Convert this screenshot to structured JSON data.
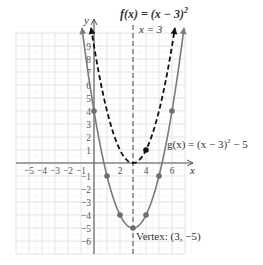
{
  "chart_data": {
    "type": "line",
    "title": "",
    "xlabel": "x",
    "ylabel": "y",
    "xlim": [
      -6,
      7
    ],
    "ylim": [
      -7,
      10
    ],
    "grid": true,
    "x_tick_labels": [
      "−5",
      "−4",
      "−3",
      "−2",
      "−1",
      "2",
      "4",
      "6"
    ],
    "x_ticks": [
      -5,
      -4,
      -3,
      -2,
      -1,
      2,
      4,
      6
    ],
    "y_tick_labels": [
      "9",
      "8",
      "7",
      "6",
      "5",
      "4",
      "3",
      "2",
      "1",
      "−1",
      "−2",
      "−3",
      "−4",
      "−5",
      "−6"
    ],
    "y_ticks": [
      9,
      8,
      7,
      6,
      5,
      4,
      3,
      2,
      1,
      -1,
      -2,
      -3,
      -4,
      -5,
      -6
    ],
    "series": [
      {
        "name": "f(x) = (x − 3)²",
        "style": "dashed",
        "color": "#111111",
        "equation": "(x-3)^2",
        "marked_points": [
          [
            4,
            1
          ]
        ]
      },
      {
        "name": "g(x) = (x − 3)² − 5",
        "style": "solid",
        "color": "#777777",
        "equation": "(x-3)^2-5",
        "marked_points": [
          [
            0,
            4
          ],
          [
            1,
            -1
          ],
          [
            2,
            -4
          ],
          [
            3,
            -5
          ],
          [
            4,
            -4
          ],
          [
            5,
            -1
          ],
          [
            6,
            4
          ]
        ]
      }
    ],
    "axis_of_symmetry": {
      "label": "x = 3",
      "x": 3,
      "style": "dashed"
    },
    "annotations": [
      {
        "text": "f(x) = (x − 3)²",
        "target": "f"
      },
      {
        "text": "x = 3",
        "target": "axis_of_symmetry"
      },
      {
        "text": "g(x) = (x − 3)² − 5",
        "target": "g"
      },
      {
        "text": "Vertex: (3, −5)",
        "target": "vertex",
        "point": [
          3,
          -5
        ]
      }
    ]
  },
  "labels": {
    "x_axis": "x",
    "y_axis": "y",
    "f_label_fx": "f(x)",
    "f_label_rest": " = (x − 3)",
    "f_label_exp": "2",
    "axis_label": "x = 3",
    "g_label": "g(x) = (x − 3)",
    "g_label_exp": "2",
    "g_label_tail": " − 5",
    "vertex_label": "Vertex: (3, −5)"
  }
}
